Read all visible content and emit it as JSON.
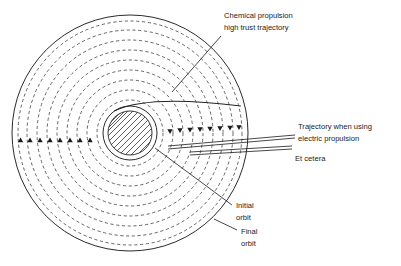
{
  "diagram": {
    "labels": {
      "chemical_line1": "Chemical propulsion",
      "chemical_line2": "high trust trajectory",
      "electric_line1": "Trajectory when using",
      "electric_line2": "electric propulsion",
      "et_cetera": "Et cetera",
      "initial_line1": "Initial",
      "initial_line2": "orbit",
      "final_line1": "Final",
      "final_line2": "orbit"
    },
    "caption": "",
    "colors": {
      "stroke_solid": "#1f1f1f",
      "stroke_dashed": "#4a4a4a",
      "text": "#1b1b1b",
      "background": "#ffffff",
      "hatch": "#2a2a2a"
    },
    "geometry": {
      "center_x": 130,
      "center_y": 133,
      "outer_radius": 118,
      "inner_body_radius": 22,
      "body_ring_radius": 27,
      "dashed_ring_count": 9,
      "left_arrow_count": 8,
      "right_arrow_count": 9
    }
  }
}
